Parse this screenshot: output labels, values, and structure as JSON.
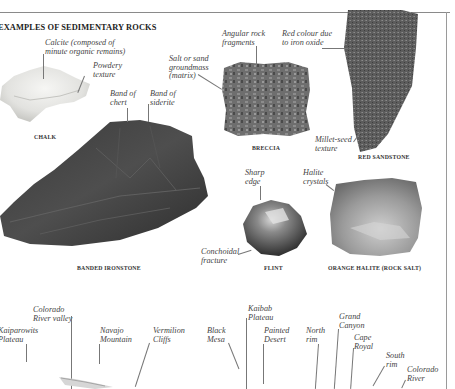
{
  "section": {
    "heading": "EXAMPLES OF SEDIMENTARY ROCKS"
  },
  "rocks": [
    {
      "name": "CHALK",
      "annotations": [
        "Calcite (composed of\nminute organic remains)",
        "Powdery\ntexture"
      ]
    },
    {
      "name": "BANDED IRONSTONE",
      "annotations": [
        "Band of\nchert",
        "Band of\nsiderite"
      ]
    },
    {
      "name": "BRECCIA",
      "annotations": [
        "Angular rock\nfragments",
        "Salt or sand\ngroundmass\n(matrix)"
      ]
    },
    {
      "name": "RED SANDSTONE",
      "annotations": [
        "Red colour due\nto iron oxide",
        "Millet-seed\ntexture"
      ]
    },
    {
      "name": "FLINT",
      "annotations": [
        "Sharp\nedge",
        "Conchoidal\nfracture"
      ]
    },
    {
      "name": "ORANGE HALITE (ROCK SALT)",
      "annotations": [
        "Halite\ncrystals"
      ]
    }
  ],
  "landscape_labels": [
    "Colorado\nRiver valley",
    "Kaiparowits\nPlateau",
    "Navajo\nMountain",
    "Vermilion\nCliffs",
    "Black\nMesa",
    "Kaibab\nPlateau",
    "Painted\nDesert",
    "North\nrim",
    "Grand\nCanyon",
    "Cape\nRoyal",
    "South\nrim",
    "Colorado\nRiver"
  ],
  "colors": {
    "text": "#444444",
    "caption": "#333333",
    "rule": "#8a8a8a"
  }
}
